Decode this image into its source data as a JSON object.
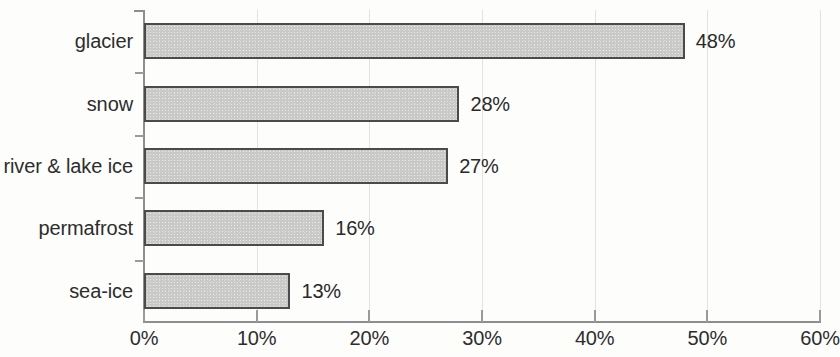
{
  "chart_data": {
    "type": "bar",
    "orientation": "horizontal",
    "title": "",
    "subtitle": "",
    "xlabel": "",
    "ylabel": "",
    "categories": [
      "glacier",
      "snow",
      "river & lake ice",
      "permafrost",
      "sea-ice"
    ],
    "values": [
      48,
      28,
      27,
      16,
      13
    ],
    "value_labels": [
      "48%",
      "28%",
      "27%",
      "16%",
      "13%"
    ],
    "xlim": [
      0,
      60
    ],
    "xtick_values": [
      0,
      10,
      20,
      30,
      40,
      50,
      60
    ],
    "xtick_labels": [
      "0%",
      "10%",
      "20%",
      "30%",
      "40%",
      "50%",
      "60%"
    ],
    "grid": "vertical",
    "legend": "none",
    "series": [
      {
        "name": "share",
        "values": [
          48,
          28,
          27,
          16,
          13
        ]
      }
    ],
    "colors": {
      "bar_fill": "#c9c9c7",
      "bar_border": "#4b4b4b",
      "gridline": "#e2e2e2",
      "axis": "#8e8e8e",
      "text": "#2d2d2d",
      "background": "#fdfdfc"
    }
  }
}
